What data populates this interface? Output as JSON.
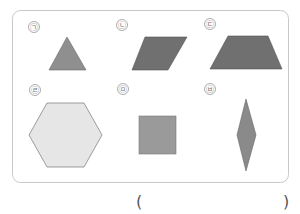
{
  "question": {
    "frame": {
      "border_color": "#c8c8c8",
      "background": "#ffffff"
    },
    "shapes": [
      {
        "label": "㉠",
        "shape": "triangle",
        "fill": "#8f8f8f"
      },
      {
        "label": "㉡",
        "shape": "parallelogram",
        "fill": "#707070"
      },
      {
        "label": "㉢",
        "shape": "trapezoid",
        "fill": "#707070"
      },
      {
        "label": "㉣",
        "shape": "hexagon",
        "fill": "#e6e6e6"
      },
      {
        "label": "㉤",
        "shape": "square",
        "fill": "#9a9a9a"
      },
      {
        "label": "㉥",
        "shape": "rhombus",
        "fill": "#8a8a8a"
      }
    ],
    "answer": {
      "open_paren": "(",
      "close_paren": ")",
      "value": ""
    }
  }
}
